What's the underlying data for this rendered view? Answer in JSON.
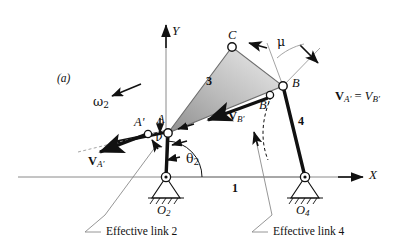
{
  "figure": {
    "panel_label": "(a)",
    "type": "four-bar-linkage-velocity-diagram"
  },
  "axes": {
    "x_label": "X",
    "y_label": "Y",
    "origin_note": "O2 at axis crossing"
  },
  "points": {
    "A": "A",
    "A_prime": "A'",
    "B": "B",
    "B_prime": "B'",
    "C": "C",
    "O2": "O",
    "O2_sub": "2",
    "O4": "O",
    "O4_sub": "4"
  },
  "links": {
    "ground": "1",
    "coupler": "3",
    "output": "4",
    "effective_link_2": "Effective link 2",
    "effective_link_4": "Effective link 4"
  },
  "vectors": {
    "v_a_prime_bold": "V",
    "v_a_prime_sub": "A'",
    "v_b_prime_bold": "V",
    "v_b_prime_sub": "B'",
    "equation_lhs_bold": "V",
    "equation_lhs_sub": "A'",
    "equation_eq": " = ",
    "equation_rhs": "V",
    "equation_rhs_sub": "B'"
  },
  "angles": {
    "omega2": "ω",
    "omega2_sub": "2",
    "theta2": "θ",
    "theta2_sub": "2",
    "mu": "μ",
    "nu": "ν"
  },
  "colors": {
    "line": "#111111",
    "thin_line": "#8a8a8a",
    "coupler_fill_light": "#e6e6e6",
    "coupler_fill_dark": "#9a9a9a",
    "background": "#ffffff"
  }
}
